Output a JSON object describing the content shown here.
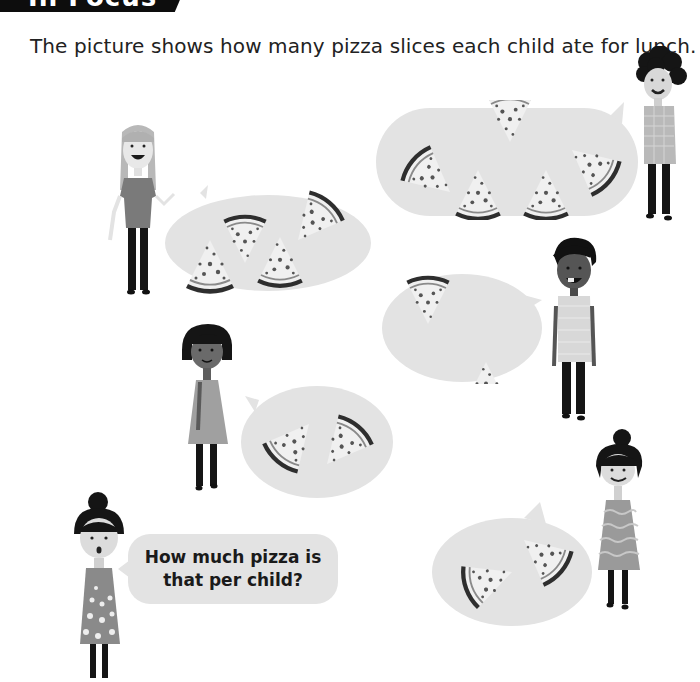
{
  "header": {
    "banner_label": "In Focus",
    "banner_color": "#0d0d0d"
  },
  "intro": {
    "text": "The picture shows how many pizza slices each child ate for lunch."
  },
  "question_bubble": {
    "line1": "How much pizza is",
    "line2": "that per child?"
  },
  "children": [
    {
      "id": "girl-long-hair",
      "position": "top-left",
      "pizza_slices": 4
    },
    {
      "id": "boy-curly-hair",
      "position": "top-right",
      "pizza_slices": 5
    },
    {
      "id": "boy-dark-hair",
      "position": "middle-right",
      "pizza_slices": 2
    },
    {
      "id": "girl-bob-hair",
      "position": "middle-left",
      "pizza_slices": 2
    },
    {
      "id": "girl-bun-right",
      "position": "bottom-right",
      "pizza_slices": 2
    },
    {
      "id": "girl-bun-left",
      "position": "bottom-left",
      "role": "asks question"
    }
  ],
  "colors": {
    "bubble": "#e3e3e3",
    "crust": "#3a3a3a",
    "cheese": "#f2f2f2",
    "topping": "#555555"
  }
}
